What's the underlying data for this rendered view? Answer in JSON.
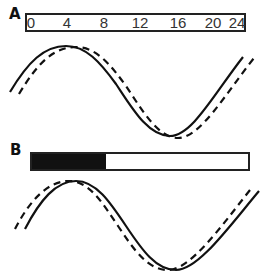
{
  "panels": [
    {
      "label": "A",
      "time_axis": {
        "ticks": [
          "0",
          "4",
          "8",
          "12",
          "16",
          "20",
          "24"
        ],
        "range": [
          0,
          24
        ]
      },
      "curves": [
        {
          "name": "solid",
          "style": "solid",
          "description": "reference rhythm"
        },
        {
          "name": "dashed",
          "style": "dashed",
          "description": "phase-delayed rhythm"
        }
      ]
    },
    {
      "label": "B",
      "light_dark_bar": {
        "dark_fraction": 0.34,
        "dark_color": "#111111",
        "light_color": "#ffffff"
      },
      "curves": [
        {
          "name": "solid",
          "style": "solid",
          "description": "reference rhythm"
        },
        {
          "name": "dashed",
          "style": "dashed",
          "description": "phase-advanced rhythm"
        }
      ]
    }
  ],
  "colors": {
    "line": "#111111",
    "background": "#ffffff"
  }
}
